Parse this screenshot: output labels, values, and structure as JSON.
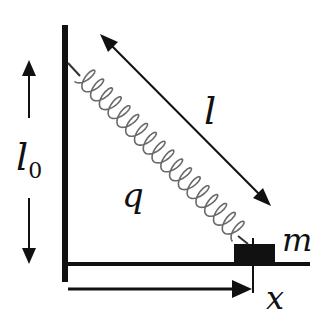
{
  "diagram": {
    "colors": {
      "ink": "#111111",
      "spring": "#666666",
      "background": "#ffffff"
    },
    "labels": {
      "l0_main": "l",
      "l0_sub": "0",
      "l": "l",
      "q": "q",
      "m": "m",
      "x": "x"
    },
    "elements": [
      {
        "id": "wall",
        "type": "vertical-line"
      },
      {
        "id": "floor",
        "type": "horizontal-line"
      },
      {
        "id": "spring",
        "type": "coil-spring"
      },
      {
        "id": "mass-block",
        "type": "block",
        "label": "m"
      },
      {
        "id": "l0-arrows",
        "type": "double-arrow",
        "label": "l0"
      },
      {
        "id": "l-arrow",
        "type": "double-arrow",
        "label": "l"
      },
      {
        "id": "x-arrow",
        "type": "arrow",
        "label": "x"
      }
    ]
  }
}
